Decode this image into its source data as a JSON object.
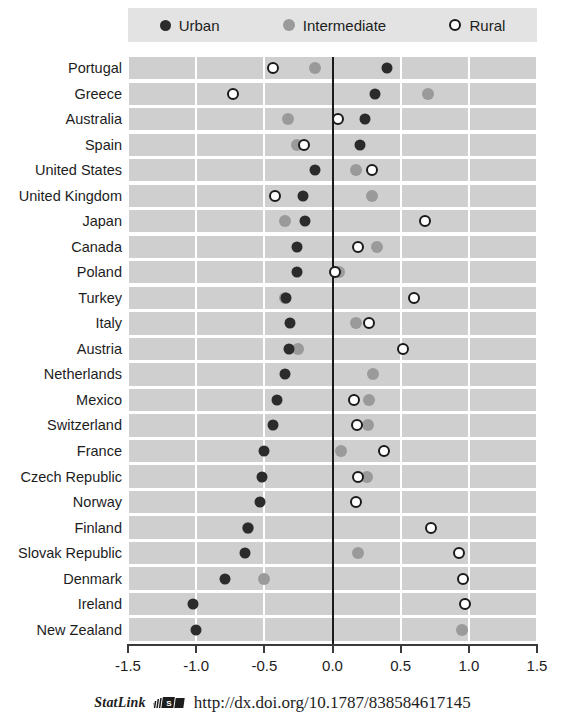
{
  "legend": {
    "entries": [
      {
        "label": "Urban",
        "marker": "filled-dark-circle-icon",
        "color": "#2b2b2b"
      },
      {
        "label": "Intermediate",
        "marker": "filled-gray-circle-icon",
        "color": "#9a9a9a"
      },
      {
        "label": "Rural",
        "marker": "open-circle-icon",
        "color": "#ffffff"
      }
    ]
  },
  "footer": {
    "statlink_label": "StatLink",
    "statlink_icon": "statlink-barcode-icon",
    "url": "http://dx.doi.org/10.1787/838584617145"
  },
  "chart_data": {
    "type": "scatter",
    "title": "",
    "xlabel": "",
    "ylabel": "",
    "xlim": [
      -1.5,
      1.5
    ],
    "xticks": [
      -1.5,
      -1.0,
      -0.5,
      0.0,
      0.5,
      1.0,
      1.5
    ],
    "xticklabels": [
      "-1.5",
      "-1.0",
      "-0.5",
      "0.0",
      "0.5",
      "1.0",
      "1.5"
    ],
    "grid": true,
    "zero_line": 0.0,
    "legend_position": "top",
    "series_names": [
      "Urban",
      "Intermediate",
      "Rural"
    ],
    "categories": [
      "Portugal",
      "Greece",
      "Australia",
      "Spain",
      "United States",
      "United Kingdom",
      "Japan",
      "Canada",
      "Poland",
      "Turkey",
      "Italy",
      "Austria",
      "Netherlands",
      "Mexico",
      "Switzerland",
      "France",
      "Czech Republic",
      "Norway",
      "Finland",
      "Slovak Republic",
      "Denmark",
      "Ireland",
      "New Zealand"
    ],
    "series": [
      {
        "name": "Urban",
        "values": [
          0.4,
          0.31,
          0.24,
          0.2,
          -0.13,
          -0.22,
          -0.2,
          -0.26,
          -0.26,
          -0.34,
          -0.31,
          -0.32,
          -0.35,
          -0.41,
          -0.44,
          -0.5,
          -0.52,
          -0.53,
          -0.62,
          -0.64,
          -0.79,
          -1.02,
          -1.0
        ]
      },
      {
        "name": "Intermediate",
        "values": [
          -0.13,
          0.7,
          -0.33,
          -0.26,
          0.17,
          0.29,
          -0.35,
          0.33,
          0.05,
          -0.35,
          0.17,
          -0.25,
          0.3,
          0.27,
          0.26,
          0.06,
          0.25,
          null,
          -0.62,
          0.19,
          -0.5,
          null,
          0.95
        ]
      },
      {
        "name": "Rural",
        "values": [
          -0.44,
          -0.73,
          0.04,
          -0.21,
          0.29,
          -0.42,
          0.68,
          0.19,
          0.02,
          0.6,
          0.27,
          0.52,
          null,
          0.16,
          0.18,
          0.38,
          0.19,
          0.17,
          0.72,
          0.93,
          0.96,
          0.97,
          null
        ]
      }
    ]
  }
}
